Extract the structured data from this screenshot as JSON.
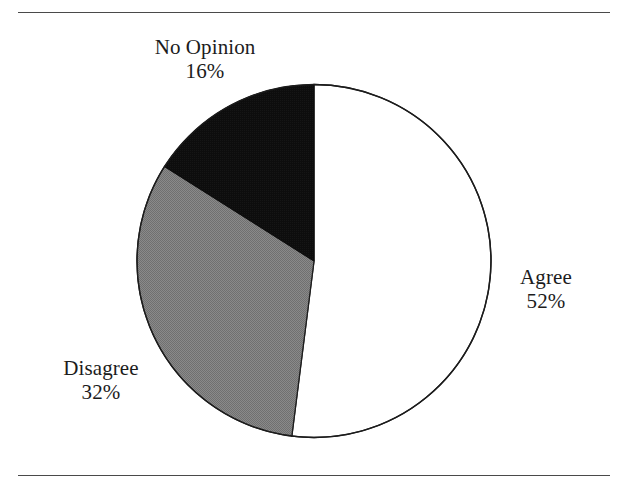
{
  "figure": {
    "background_color": "#ffffff",
    "rule_color": "#4a4a4a",
    "outline_color": "#1c1c1c"
  },
  "chart_data": {
    "type": "pie",
    "title": "",
    "subtitle": "",
    "xlabel": "",
    "ylabel": "",
    "legend_position": "none",
    "grid": false,
    "units": "percent",
    "total": 100,
    "start_angle_deg": 0,
    "direction": "clockwise",
    "categories": [
      "Agree",
      "Disagree",
      "No Opinion"
    ],
    "values": [
      52,
      32,
      16
    ],
    "value_labels": [
      "52%",
      "32%",
      "16%"
    ],
    "slices": [
      {
        "label": "Agree",
        "value": 52,
        "value_label": "52%",
        "fill": "#ffffff",
        "stroke": "#1c1c1c",
        "start_deg": 0,
        "end_deg": 187.2
      },
      {
        "label": "Disagree",
        "value": 32,
        "value_label": "32%",
        "fill": "#808080",
        "stroke": "#1c1c1c",
        "start_deg": 187.2,
        "end_deg": 302.4
      },
      {
        "label": "No Opinion",
        "value": 16,
        "value_label": "16%",
        "fill": "#0d0d0d",
        "stroke": "#1c1c1c",
        "start_deg": 302.4,
        "end_deg": 360
      }
    ],
    "annotations": []
  },
  "labels": {
    "no_opinion": {
      "name": "No Opinion",
      "value": "16%"
    },
    "agree": {
      "name": "Agree",
      "value": "52%"
    },
    "disagree": {
      "name": "Disagree",
      "value": "32%"
    }
  }
}
